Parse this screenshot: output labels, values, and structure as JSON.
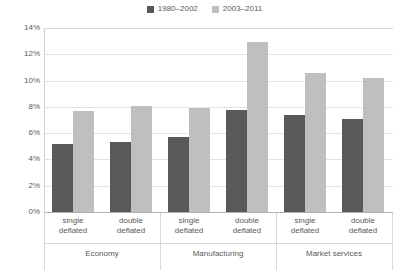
{
  "chart_data": {
    "type": "bar",
    "title": "",
    "subtitle": "",
    "xlabel": "",
    "ylabel": "",
    "ylim": [
      0,
      14
    ],
    "y_tick_labels": [
      "14%",
      "12%",
      "10%",
      "8%",
      "6%",
      "4%",
      "2%",
      "0%"
    ],
    "y_tick_values": [
      14,
      12,
      10,
      8,
      6,
      4,
      2,
      0
    ],
    "grid": true,
    "legend_position": "top-center",
    "categories": [
      "single deflated",
      "double deflated",
      "single deflated",
      "double deflated",
      "single deflated",
      "double deflated"
    ],
    "groups": [
      "Economy",
      "Manufacturing",
      "Market services"
    ],
    "subcategories": [
      "single deflated",
      "double deflated"
    ],
    "series": [
      {
        "name": "1980–2002",
        "color": "#595959",
        "values": [
          5.2,
          5.3,
          5.7,
          7.8,
          7.4,
          7.1
        ]
      },
      {
        "name": "2003–2011",
        "color": "#bfbfbf",
        "values": [
          7.7,
          8.1,
          7.9,
          12.9,
          10.6,
          10.2
        ]
      }
    ]
  },
  "legend": {
    "entries": [
      {
        "label": "1980–2002",
        "color": "#595959",
        "swatch_name": "legend-swatch-1980-2002"
      },
      {
        "label": "2003–2011",
        "color": "#bfbfbf",
        "swatch_name": "legend-swatch-2003-2011"
      }
    ]
  },
  "axes": {
    "y": {
      "ticks": [
        "14%",
        "12%",
        "10%",
        "8%",
        "6%",
        "4%",
        "2%",
        "0%"
      ]
    },
    "x": {
      "groups": [
        {
          "name": "Economy",
          "sub": [
            "single deflated",
            "double deflated"
          ]
        },
        {
          "name": "Manufacturing",
          "sub": [
            "single deflated",
            "double deflated"
          ]
        },
        {
          "name": "Market services",
          "sub": [
            "single deflated",
            "double deflated"
          ]
        }
      ]
    }
  },
  "labels": {
    "sub_line1": "single",
    "sub_line2": "deflated",
    "sub_double_line1": "double",
    "sub_double_line2": "deflated",
    "group_economy": "Economy",
    "group_manufacturing": "Manufacturing",
    "group_market_services": "Market services"
  }
}
